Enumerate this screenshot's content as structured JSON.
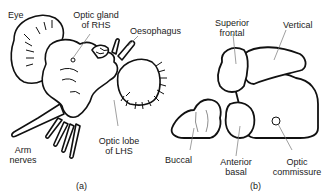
{
  "figure_a": {
    "caption": "(a)",
    "labels": {
      "eye": "Eye",
      "optic_gland_line1": "Optic gland",
      "optic_gland_line2": "of RHS",
      "oesophagus": "Oesophagus",
      "arm_nerves_line1": "Arm",
      "arm_nerves_line2": "nerves",
      "optic_lobe_line1": "Optic lobe",
      "optic_lobe_line2": "of LHS"
    }
  },
  "figure_b": {
    "caption": "(b)",
    "labels": {
      "superior_frontal_line1": "Superior",
      "superior_frontal_line2": "frontal",
      "vertical": "Vertical",
      "buccal": "Buccal",
      "anterior_basal_line1": "Anterior",
      "anterior_basal_line2": "basal",
      "optic_commissure_line1": "Optic",
      "optic_commissure_line2": "commissure"
    }
  },
  "colors": {
    "ink": "#111111",
    "leader": "#777777",
    "background": "#ffffff"
  }
}
